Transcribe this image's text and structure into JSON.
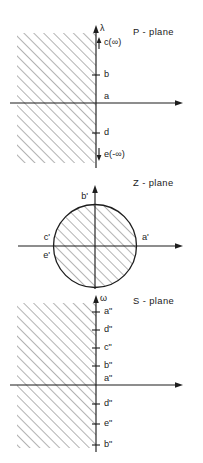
{
  "figure": {
    "name": "complex-plane-mapping-figure",
    "background": "#ffffff",
    "ink_color": "#1d1d1d",
    "hatch_color": "#4a4a4a"
  },
  "panels": [
    {
      "id": "p-plane",
      "title": "P - plane",
      "vertical_axis_label": "λ",
      "shaded_region": "left half-plane",
      "markers": [
        {
          "label": "c(∞)",
          "arrow": "up",
          "prefix": "↑"
        },
        {
          "label": "b",
          "arrow": "none",
          "prefix": ""
        },
        {
          "label": "a",
          "arrow": "none",
          "prefix": ""
        },
        {
          "label": "d",
          "arrow": "none",
          "prefix": ""
        },
        {
          "label": "e(-∞)",
          "arrow": "down",
          "prefix": "↓"
        }
      ]
    },
    {
      "id": "z-plane",
      "title": "Z - plane",
      "shaded_region": "unit disk",
      "markers": [
        {
          "label": "b'",
          "position": "top"
        },
        {
          "label": "c'",
          "position": "left-upper"
        },
        {
          "label": "e'",
          "position": "left-lower"
        },
        {
          "label": "a'",
          "position": "right"
        },
        {
          "label": "d'",
          "position": "bottom"
        }
      ]
    },
    {
      "id": "s-plane",
      "title": "S - plane",
      "vertical_axis_label": "ω",
      "shaded_region": "left half-plane",
      "markers": [
        {
          "label": "a\""
        },
        {
          "label": "d\""
        },
        {
          "label": "c\""
        },
        {
          "label": "b\""
        },
        {
          "label": "a\""
        },
        {
          "label": "d\""
        },
        {
          "label": "e\""
        },
        {
          "label": "b\""
        }
      ]
    }
  ]
}
